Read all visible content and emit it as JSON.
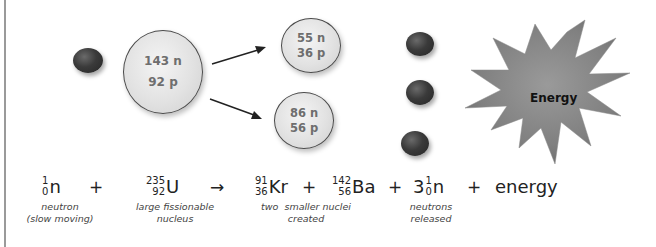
{
  "diagram": {
    "nuclei": {
      "uranium": {
        "line1": "143 n",
        "line2": "92 p"
      },
      "krypton": {
        "line1": "55 n",
        "line2": "36 p"
      },
      "barium": {
        "line1": "86 n",
        "line2": "56 p"
      }
    },
    "starburst_label": "Energy",
    "icons": {
      "incoming_neutron": "neutron-sphere",
      "released_neutrons": [
        "neutron-sphere",
        "neutron-sphere",
        "neutron-sphere"
      ],
      "arrows": [
        "arrow-up-right",
        "arrow-down-right"
      ]
    },
    "colors": {
      "neutron": "#2e2e2e",
      "nucleus_fill": "#e2e2e2",
      "nucleus_text": "#6e6e6e",
      "starburst": "#7f7f7f"
    }
  },
  "equation": {
    "neutron_in": {
      "mass": "1",
      "atomic": "0",
      "symbol": "n"
    },
    "plus1": "+",
    "uranium": {
      "mass": "235",
      "atomic": "92",
      "symbol": "U"
    },
    "arrow": "→",
    "krypton": {
      "mass": "91",
      "atomic": "36",
      "symbol": "Kr"
    },
    "plus2": "+",
    "barium": {
      "mass": "142",
      "atomic": "56",
      "symbol": "Ba"
    },
    "plus3": "+",
    "neutrons_out": {
      "coefficient": "3",
      "mass": "1",
      "atomic": "0",
      "symbol": "n"
    },
    "plus4": "+",
    "energy": "energy"
  },
  "captions": {
    "neutron": {
      "line1": "neutron",
      "line2": "(slow moving)"
    },
    "uranium": {
      "line1": "large fissionable",
      "line2": "nucleus"
    },
    "products": {
      "line1": "two  smaller nuclei",
      "line2": "created"
    },
    "neutrons": {
      "line1": "neutrons",
      "line2": "released"
    }
  }
}
